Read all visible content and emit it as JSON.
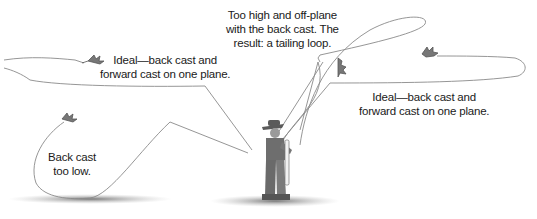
{
  "figure": {
    "annotations": {
      "ideal_left": [
        "Ideal—back cast and",
        "forward cast on one plane."
      ],
      "tailing_loop": [
        "Too high and off-plane",
        "with the back cast. The",
        "result: a tailing loop."
      ],
      "ideal_right": [
        "Ideal—back cast and",
        "forward cast on one plane."
      ],
      "too_low": [
        "Back cast",
        "too low."
      ]
    },
    "elements": {
      "angler": "angler-with-fly-rod",
      "fly": "dry-fly-icon",
      "line": "fly-line-loop"
    },
    "colors": {
      "line": "#8a8a8a",
      "text": "#1a1a1a",
      "ground": "#9a9a9a"
    }
  }
}
